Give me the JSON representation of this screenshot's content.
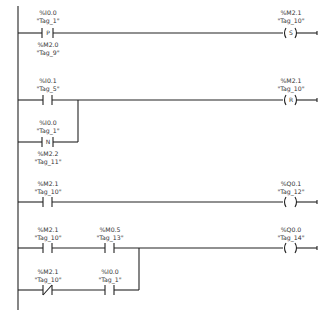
{
  "diagram": {
    "type": "ladder-logic",
    "rungs": [
      {
        "id": 1,
        "contacts": [
          {
            "kind": "positive-edge",
            "symbol": "P",
            "address": "%I0.0",
            "tag": "\"Tag_1\"",
            "memory_address": "%M2.0",
            "memory_tag": "\"Tag_9\""
          }
        ],
        "coil": {
          "kind": "set",
          "symbol": "S",
          "address": "%M2.1",
          "tag": "\"Tag_10\""
        }
      },
      {
        "id": 2,
        "contacts": [
          {
            "kind": "normally-open",
            "address": "%I0.1",
            "tag": "\"Tag_5\""
          }
        ],
        "branch": [
          {
            "kind": "negative-edge",
            "symbol": "N",
            "address": "%I0.0",
            "tag": "\"Tag_1\"",
            "memory_address": "%M2.2",
            "memory_tag": "\"Tag_11\""
          }
        ],
        "coil": {
          "kind": "reset",
          "symbol": "R",
          "address": "%M2.1",
          "tag": "\"Tag_10\""
        }
      },
      {
        "id": 3,
        "contacts": [
          {
            "kind": "normally-open",
            "address": "%M2.1",
            "tag": "\"Tag_10\""
          }
        ],
        "coil": {
          "kind": "output",
          "symbol": "",
          "address": "%Q0.1",
          "tag": "\"Tag_12\""
        }
      },
      {
        "id": 4,
        "contacts": [
          {
            "kind": "normally-open",
            "address": "%M2.1",
            "tag": "\"Tag_10\""
          },
          {
            "kind": "normally-open",
            "address": "%M0.5",
            "tag": "\"Tag_13\""
          }
        ],
        "branch": [
          {
            "kind": "normally-closed",
            "address": "%M2.1",
            "tag": "\"Tag_10\""
          },
          {
            "kind": "normally-open",
            "address": "%I0.0",
            "tag": "\"Tag_1\""
          }
        ],
        "coil": {
          "kind": "output",
          "symbol": "",
          "address": "%Q0.0",
          "tag": "\"Tag_14\""
        }
      }
    ]
  },
  "labels": {
    "r1c1_addr": "%I0.0",
    "r1c1_tag": "\"Tag_1\"",
    "r1c1_sym": "P",
    "r1c1_maddr": "%M2.0",
    "r1c1_mtag": "\"Tag_9\"",
    "r1coil_addr": "%M2.1",
    "r1coil_tag": "\"Tag_10\"",
    "r1coil_sym": "S",
    "r2c1_addr": "%I0.1",
    "r2c1_tag": "\"Tag_5\"",
    "r2b1_addr": "%I0.0",
    "r2b1_tag": "\"Tag_1\"",
    "r2b1_sym": "N",
    "r2b1_maddr": "%M2.2",
    "r2b1_mtag": "\"Tag_11\"",
    "r2coil_addr": "%M2.1",
    "r2coil_tag": "\"Tag_10\"",
    "r2coil_sym": "R",
    "r3c1_addr": "%M2.1",
    "r3c1_tag": "\"Tag_10\"",
    "r3coil_addr": "%Q0.1",
    "r3coil_tag": "\"Tag_12\"",
    "r4c1_addr": "%M2.1",
    "r4c1_tag": "\"Tag_10\"",
    "r4c2_addr": "%M0.5",
    "r4c2_tag": "\"Tag_13\"",
    "r4b1_addr": "%M2.1",
    "r4b1_tag": "\"Tag_10\"",
    "r4b2_addr": "%I0.0",
    "r4b2_tag": "\"Tag_1\"",
    "r4coil_addr": "%Q0.0",
    "r4coil_tag": "\"Tag_14\""
  },
  "colors": {
    "line": "#222222",
    "text": "#333333",
    "background": "#ffffff"
  }
}
